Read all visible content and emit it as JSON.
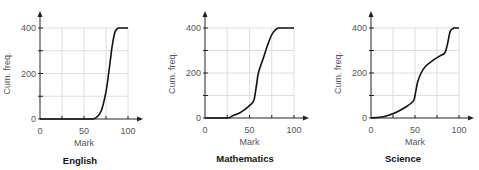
{
  "chart_data": [
    {
      "type": "line",
      "title": "English",
      "xlabel": "Mark",
      "ylabel": "Cum. freq.",
      "xlim": [
        0,
        100
      ],
      "ylim": [
        0,
        400
      ],
      "xticks": [
        0,
        50,
        100
      ],
      "yticks": [
        0,
        200,
        400
      ],
      "grid": true,
      "series": [
        {
          "name": "English",
          "x": [
            0,
            55,
            60,
            65,
            70,
            75,
            78,
            80,
            82,
            85,
            88,
            90,
            100
          ],
          "y": [
            0,
            0,
            0,
            10,
            40,
            120,
            200,
            260,
            320,
            380,
            398,
            400,
            400
          ]
        }
      ]
    },
    {
      "type": "line",
      "title": "Mathematics",
      "xlabel": "Mark",
      "ylabel": "Cum. freq.",
      "xlim": [
        0,
        100
      ],
      "ylim": [
        0,
        400
      ],
      "xticks": [
        0,
        50,
        100
      ],
      "yticks": [
        0,
        200,
        400
      ],
      "grid": true,
      "series": [
        {
          "name": "Mathematics",
          "x": [
            0,
            25,
            30,
            40,
            50,
            55,
            58,
            60,
            65,
            70,
            75,
            80,
            85,
            100
          ],
          "y": [
            0,
            0,
            8,
            25,
            55,
            80,
            150,
            200,
            260,
            320,
            370,
            395,
            400,
            400
          ]
        }
      ]
    },
    {
      "type": "line",
      "title": "Science",
      "xlabel": "Mark",
      "ylabel": "Cum. freq.",
      "xlim": [
        0,
        100
      ],
      "ylim": [
        0,
        400
      ],
      "xticks": [
        0,
        50,
        100
      ],
      "yticks": [
        0,
        200,
        400
      ],
      "grid": true,
      "series": [
        {
          "name": "Science",
          "x": [
            0,
            10,
            20,
            30,
            40,
            48,
            50,
            53,
            57,
            62,
            70,
            78,
            84,
            87,
            90,
            94,
            100
          ],
          "y": [
            0,
            3,
            12,
            28,
            50,
            75,
            100,
            160,
            200,
            230,
            255,
            275,
            290,
            330,
            385,
            400,
            400
          ]
        }
      ]
    }
  ]
}
